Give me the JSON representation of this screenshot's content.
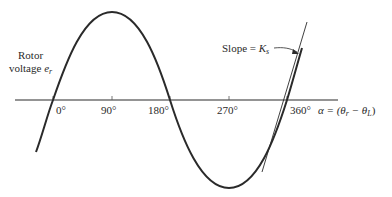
{
  "diagram": {
    "type": "sine-wave-with-tangent",
    "y_label_line1": "Rotor",
    "y_label_line2": "voltage",
    "y_label_symbol": "e",
    "y_label_subscript": "r",
    "x_ticks": [
      "0°",
      "90°",
      "180°",
      "270°",
      "360°"
    ],
    "x_axis_label_prefix": "α = (θ",
    "x_axis_label_sub1": "r",
    "x_axis_label_mid": " − θ",
    "x_axis_label_sub2": "L",
    "x_axis_label_suffix": ")",
    "slope_label_prefix": "Slope = ",
    "slope_label_symbol": "K",
    "slope_label_subscript": "s",
    "colors": {
      "line": "#2a2a2a",
      "background": "#ffffff"
    }
  }
}
